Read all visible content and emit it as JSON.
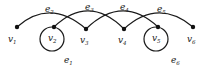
{
  "diagram": {
    "type": "graph",
    "nodes": [
      {
        "id": "v1",
        "label": "v",
        "sub": "1",
        "x": 17,
        "y": 27,
        "lx": 8,
        "ly": 42
      },
      {
        "id": "v2",
        "label": "v",
        "sub": "2",
        "x": 54,
        "y": 27,
        "lx": 48,
        "ly": 41
      },
      {
        "id": "v3",
        "label": "v",
        "sub": "3",
        "x": 86,
        "y": 29,
        "lx": 80,
        "ly": 43
      },
      {
        "id": "v4",
        "label": "v",
        "sub": "4",
        "x": 124,
        "y": 29,
        "lx": 118,
        "ly": 43
      },
      {
        "id": "v5",
        "label": "v",
        "sub": "5",
        "x": 158,
        "y": 27,
        "lx": 152,
        "ly": 41
      },
      {
        "id": "v6",
        "label": "v",
        "sub": "6",
        "x": 193,
        "y": 27,
        "lx": 187,
        "ly": 42
      }
    ],
    "edges": [
      {
        "id": "e1",
        "label": "e",
        "sub": "1",
        "from": "v2",
        "to": "v2",
        "loop": true,
        "lx": 64,
        "ly": 63
      },
      {
        "id": "e2",
        "label": "e",
        "sub": "2",
        "from": "v1",
        "to": "v3",
        "lx": 45,
        "ly": 12
      },
      {
        "id": "e3",
        "label": "e",
        "sub": "3",
        "from": "v2",
        "to": "v4",
        "lx": 85,
        "ly": 10
      },
      {
        "id": "e4",
        "label": "e",
        "sub": "4",
        "from": "v3",
        "to": "v5",
        "lx": 120,
        "ly": 10
      },
      {
        "id": "e5",
        "label": "e",
        "sub": "5",
        "from": "v4",
        "to": "v6",
        "lx": 157,
        "ly": 12
      },
      {
        "id": "e6",
        "label": "e",
        "sub": "6",
        "from": "v5",
        "to": "v5",
        "loop": true,
        "lx": 171,
        "ly": 63
      }
    ]
  }
}
